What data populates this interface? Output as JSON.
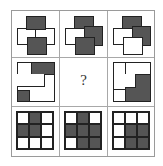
{
  "puzzle": {
    "question_mark": "?",
    "colors": {
      "dark": "#555555",
      "light": "#ffffff",
      "line": "#222222",
      "grid": "#a8a8a8"
    },
    "row1": [
      {
        "top": "dark",
        "left": "light",
        "right": "light",
        "bottom": "dark"
      },
      {
        "top": "dark",
        "left": "light",
        "right": "dark",
        "bottom": "dark"
      },
      {
        "top": "dark",
        "left": "light",
        "right": "dark",
        "bottom": "light"
      }
    ],
    "row3": [
      [
        "light",
        "dark",
        "light",
        "dark",
        "dark",
        "light",
        "light",
        "light",
        "light"
      ],
      [
        "light",
        "dark",
        "light",
        "dark",
        "dark",
        "dark",
        "light",
        "dark",
        "dark"
      ],
      [
        "light",
        "light",
        "light",
        "light",
        "dark",
        "dark",
        "light",
        "dark",
        "dark"
      ]
    ]
  }
}
